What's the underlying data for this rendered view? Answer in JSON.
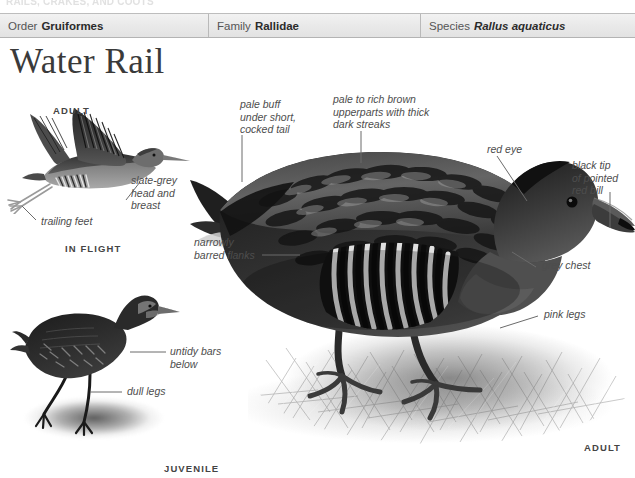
{
  "running_head": "RAILS, CRAKES, AND COOTS",
  "taxonomy": {
    "cells": [
      {
        "key": "Order",
        "value": "Gruiformes",
        "italic": false
      },
      {
        "key": "Family",
        "value": "Rallidae",
        "italic": false
      },
      {
        "key": "Species",
        "value": "Rallus aquaticus",
        "italic": true
      }
    ]
  },
  "title": "Water Rail",
  "captions": {
    "flight_adult": "ADULT",
    "in_flight": "IN FLIGHT",
    "juvenile": "JUVENILE",
    "adult": "ADULT"
  },
  "annotations": [
    {
      "id": "slate-grey-head-and-breast",
      "text": "slate-grey\nhead and\nbreast"
    },
    {
      "id": "trailing-feet",
      "text": "trailing feet"
    },
    {
      "id": "pale-buff-under-tail",
      "text": "pale buff\nunder short,\ncocked tail"
    },
    {
      "id": "pale-to-rich-brown-upperparts",
      "text": "pale to rich brown\nupperparts with thick\ndark streaks"
    },
    {
      "id": "red-eye",
      "text": "red eye"
    },
    {
      "id": "black-tip-red-bill",
      "text": "black tip\nof pointed\nred bill"
    },
    {
      "id": "narrowly-barred-flanks",
      "text": "narrowly\nbarred flanks"
    },
    {
      "id": "grey-chest",
      "text": "grey chest"
    },
    {
      "id": "pink-legs",
      "text": "pink legs"
    },
    {
      "id": "untidy-bars-below",
      "text": "untidy bars\nbelow"
    },
    {
      "id": "dull-legs",
      "text": "dull legs"
    }
  ],
  "colors": {
    "header_background": "#eaeaea",
    "header_border": "#b3b3b3",
    "title_text": "#3a3a3a",
    "annotation_text": "#4d4d4d",
    "leader_line": "#6b6b6b",
    "caption_text": "#444444",
    "page_background": "#ffffff"
  }
}
